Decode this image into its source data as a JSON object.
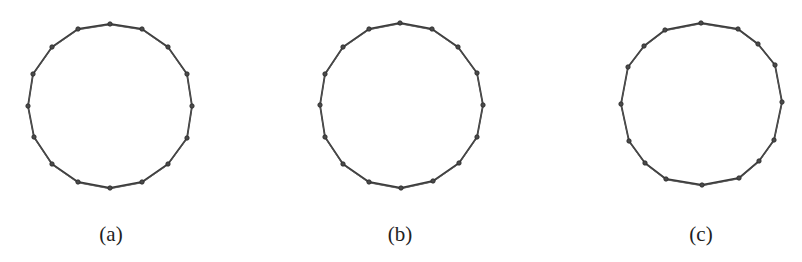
{
  "figure": {
    "panels": [
      {
        "id": "a",
        "label": "(a)",
        "label_x": 111,
        "node_count": 16,
        "nodes": [
          [
            110,
            24
          ],
          [
            142,
            29
          ],
          [
            168,
            47
          ],
          [
            187,
            74
          ],
          [
            192,
            106
          ],
          [
            187,
            138
          ],
          [
            168,
            164
          ],
          [
            142,
            182
          ],
          [
            110,
            188
          ],
          [
            78,
            182
          ],
          [
            52,
            164
          ],
          [
            34,
            137
          ],
          [
            28,
            106
          ],
          [
            33,
            74
          ],
          [
            52,
            47
          ],
          [
            78,
            29
          ]
        ]
      },
      {
        "id": "b",
        "label": "(b)",
        "label_x": 400,
        "node_count": 16,
        "nodes": [
          [
            400,
            23
          ],
          [
            432,
            29
          ],
          [
            458,
            47
          ],
          [
            477,
            73
          ],
          [
            483,
            105
          ],
          [
            477,
            137
          ],
          [
            459,
            163
          ],
          [
            433,
            181
          ],
          [
            401,
            188
          ],
          [
            369,
            182
          ],
          [
            343,
            164
          ],
          [
            325,
            137
          ],
          [
            320,
            105
          ],
          [
            325,
            74
          ],
          [
            343,
            47
          ],
          [
            369,
            29
          ]
        ]
      },
      {
        "id": "c",
        "label": "(c)",
        "label_x": 701,
        "node_count": 16,
        "nodes": [
          [
            701,
            23
          ],
          [
            738,
            29
          ],
          [
            758,
            44
          ],
          [
            775,
            65
          ],
          [
            782,
            102
          ],
          [
            774,
            140
          ],
          [
            759,
            161
          ],
          [
            739,
            178
          ],
          [
            702,
            185
          ],
          [
            666,
            179
          ],
          [
            645,
            163
          ],
          [
            629,
            141
          ],
          [
            621,
            104
          ],
          [
            628,
            67
          ],
          [
            644,
            46
          ],
          [
            665,
            30
          ]
        ]
      }
    ]
  }
}
